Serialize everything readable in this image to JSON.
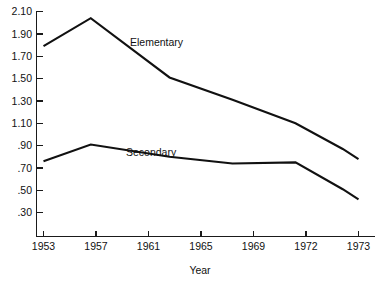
{
  "chart_data": {
    "type": "line",
    "title": "",
    "xlabel": "Year",
    "ylabel": "",
    "grid": false,
    "legend_position": "inline-annotation",
    "x": [
      1953,
      1956,
      1961,
      1965,
      1969,
      1972,
      1973
    ],
    "categories": [
      "1953",
      "1957",
      "1961",
      "1965",
      "1969",
      "1972",
      "1973"
    ],
    "x_tick_labels": [
      "1953",
      "1957",
      "1961",
      "1965",
      "1969",
      "1972",
      "1973"
    ],
    "y_tick_labels": [
      "2.10",
      "1.90",
      "1.70",
      "1.50",
      "1.30",
      "1.10",
      ".90",
      ".70",
      ".50",
      ".30"
    ],
    "y_tick_values": [
      2.1,
      1.9,
      1.7,
      1.5,
      1.3,
      1.1,
      0.9,
      0.7,
      0.5,
      0.3
    ],
    "ylim": [
      0.22,
      2.1
    ],
    "xlim": [
      1953,
      1973
    ],
    "series": [
      {
        "name": "Elementary",
        "label": "Elementary",
        "color": "#111111",
        "points": [
          {
            "x": 1953,
            "y": 1.79
          },
          {
            "x": 1956,
            "y": 2.04
          },
          {
            "x": 1961,
            "y": 1.51
          },
          {
            "x": 1965,
            "y": 1.31
          },
          {
            "x": 1969,
            "y": 1.1
          },
          {
            "x": 1972,
            "y": 0.87
          },
          {
            "x": 1973,
            "y": 0.78
          }
        ],
        "values": [
          1.79,
          2.04,
          1.51,
          1.31,
          1.1,
          0.87,
          0.78
        ]
      },
      {
        "name": "Secondary",
        "label": "Secondary",
        "color": "#111111",
        "points": [
          {
            "x": 1953,
            "y": 0.76
          },
          {
            "x": 1956,
            "y": 0.91
          },
          {
            "x": 1961,
            "y": 0.8
          },
          {
            "x": 1965,
            "y": 0.74
          },
          {
            "x": 1969,
            "y": 0.75
          },
          {
            "x": 1972,
            "y": 0.51
          },
          {
            "x": 1973,
            "y": 0.42
          }
        ],
        "values": [
          0.76,
          0.91,
          0.8,
          0.74,
          0.75,
          0.51,
          0.42
        ]
      }
    ],
    "annotations": [
      {
        "text": "Elementary",
        "x": 1957.6,
        "y": 1.82
      },
      {
        "text": "Secondary",
        "x": 1957.2,
        "y": 0.98
      }
    ]
  }
}
